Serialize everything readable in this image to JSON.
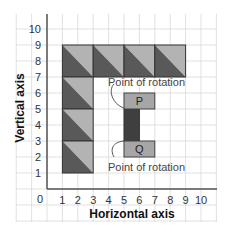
{
  "diagram": {
    "type": "grid-rotation-diagram",
    "x_axis": {
      "title": "Horizontal axis",
      "origin_label": "0",
      "ticks": [
        "1",
        "2",
        "3",
        "4",
        "5",
        "6",
        "7",
        "8",
        "9",
        "10"
      ]
    },
    "y_axis": {
      "title": "Vertical axis",
      "ticks": [
        "1",
        "2",
        "3",
        "4",
        "5",
        "6",
        "7",
        "8",
        "9",
        "10"
      ]
    },
    "tiles": [
      {
        "x": 1,
        "y": 7,
        "w": 2,
        "h": 2
      },
      {
        "x": 3,
        "y": 7,
        "w": 2,
        "h": 2
      },
      {
        "x": 5,
        "y": 7,
        "w": 2,
        "h": 2
      },
      {
        "x": 7,
        "y": 7,
        "w": 2,
        "h": 2
      },
      {
        "x": 1,
        "y": 5,
        "w": 2,
        "h": 2
      },
      {
        "x": 1,
        "y": 3,
        "w": 2,
        "h": 2
      },
      {
        "x": 1,
        "y": 1,
        "w": 2,
        "h": 2
      }
    ],
    "shape": {
      "p_label": "P",
      "q_label": "Q",
      "p_rect": {
        "x": 5,
        "y": 5,
        "w": 2,
        "h": 1
      },
      "bar": {
        "x": 5,
        "y": 3,
        "w": 1,
        "h": 2
      },
      "q_rect": {
        "x": 5,
        "y": 2,
        "w": 2,
        "h": 1
      }
    },
    "annotations": {
      "top": "Point of rotation",
      "bottom": "Point of rotation"
    },
    "colors": {
      "tile_dark": "#595959",
      "tile_light": "#b3b3b3",
      "pq_fill": "#a6a6a6",
      "bar_fill": "#3f3f3f",
      "grid_line": "#d9d9d9",
      "axis_line": "#555555"
    }
  }
}
